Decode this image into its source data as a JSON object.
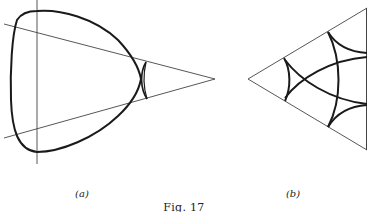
{
  "figure": {
    "caption": "Fig. 17",
    "panels": [
      {
        "id": "a",
        "label": "(a)"
      },
      {
        "id": "b",
        "label": "(b)"
      }
    ]
  },
  "colors": {
    "ink": "#1a1a1a",
    "thin_line": "#444444",
    "background": "#ffffff"
  }
}
